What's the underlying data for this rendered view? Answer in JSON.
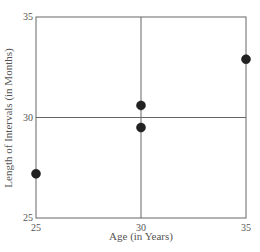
{
  "chart_data": {
    "type": "scatter",
    "title": "",
    "xlabel": "Age (in Years)",
    "ylabel": "Length of Intervals (in Months)",
    "xlim": [
      25,
      35
    ],
    "ylim": [
      25,
      35
    ],
    "xticks": [
      25,
      30,
      35
    ],
    "yticks": [
      25,
      30,
      35
    ],
    "grid": "center cross lines at x=30 and y=30",
    "legend": null,
    "series": [
      {
        "name": "observations",
        "points": [
          {
            "x": 25,
            "y": 27.2
          },
          {
            "x": 30,
            "y": 30.6
          },
          {
            "x": 30,
            "y": 29.5
          },
          {
            "x": 35,
            "y": 32.9
          }
        ]
      }
    ]
  },
  "colors": {
    "axis": "#666666",
    "point": "#222222",
    "text": "#555555"
  }
}
